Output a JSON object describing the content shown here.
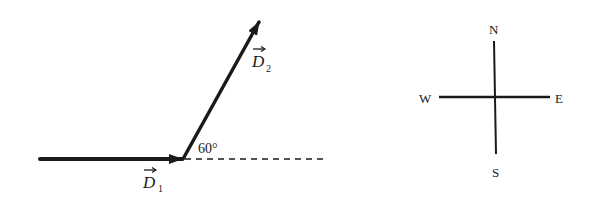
{
  "diagram": {
    "vectors": [
      {
        "name": "D1",
        "label_letter": "D",
        "label_subscript": "1",
        "direction": "east",
        "start": [
          40,
          159
        ],
        "end": [
          183,
          159
        ]
      },
      {
        "name": "D2",
        "label_letter": "D",
        "label_subscript": "2",
        "direction": "60° north of east",
        "start": [
          183,
          159
        ],
        "end": [
          259,
          22
        ]
      }
    ],
    "angle_label": "60°",
    "reference_line": "dashed horizontal extension of D1",
    "compass": {
      "north": "N",
      "south": "S",
      "east": "E",
      "west": "W"
    }
  },
  "colors": {
    "ink": "#1a1a1a",
    "background": "#ffffff"
  }
}
